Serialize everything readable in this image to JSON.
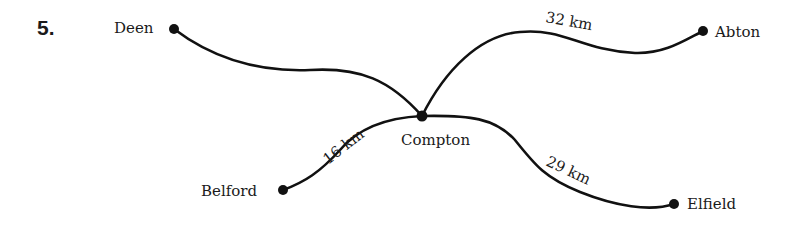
{
  "question_number": "5.",
  "towns": {
    "deen": "Deen",
    "abton": "Abton",
    "compton": "Compton",
    "belford": "Belford",
    "elfield": "Elfield"
  },
  "roads": {
    "compton_abton": "32 km",
    "compton_belford": "16 km",
    "compton_elfield": "29 km",
    "compton_deen": ""
  },
  "colors": {
    "ink": "#111111",
    "background": "#ffffff"
  }
}
